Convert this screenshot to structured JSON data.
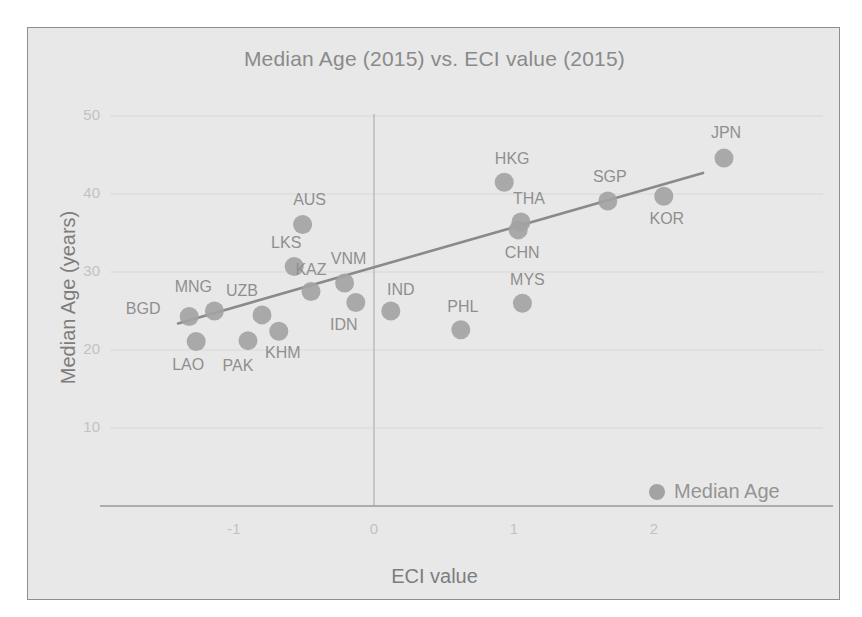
{
  "chart_data": {
    "type": "scatter",
    "title": "Median Age (2015) vs. ECI value (2015)",
    "xlabel": "ECI value",
    "ylabel": "Median Age (years)",
    "xlim": [
      -1.55,
      2.9
    ],
    "ylim": [
      0,
      53
    ],
    "xticks": [
      "-1",
      "0",
      "1",
      "2"
    ],
    "xtick_values": [
      -1,
      0,
      1,
      2
    ],
    "yticks": [
      "10",
      "20",
      "30",
      "40",
      "50"
    ],
    "ytick_values": [
      10,
      20,
      30,
      40,
      50
    ],
    "grid": true,
    "legend": [
      {
        "name": "Median Age",
        "color": "#a3a3a3",
        "marker": "circle"
      }
    ],
    "legend_position": "bottom-right",
    "marker_color": "#a3a3a3",
    "trendline": {
      "color": "#8a8a8a",
      "x_start": -1.4,
      "y_start": 23.4,
      "x_end": 2.35,
      "y_end": 42.7
    },
    "points": [
      {
        "label": "BGD",
        "x": -1.32,
        "y": 24.3,
        "label_dx": -46,
        "label_dy": -7
      },
      {
        "label": "LAO",
        "x": -1.27,
        "y": 21.1,
        "label_dx": -8,
        "label_dy": 24
      },
      {
        "label": "MNG",
        "x": -1.14,
        "y": 25.0,
        "label_dx": -21,
        "label_dy": -24
      },
      {
        "label": "PAK",
        "x": -0.9,
        "y": 21.2,
        "label_dx": -10,
        "label_dy": 25
      },
      {
        "label": "UZB",
        "x": -0.8,
        "y": 24.5,
        "label_dx": -20,
        "label_dy": -24
      },
      {
        "label": "KHM",
        "x": -0.68,
        "y": 22.4,
        "label_dx": 4,
        "label_dy": 22
      },
      {
        "label": "LKS",
        "x": -0.57,
        "y": 30.7,
        "label_dx": -8,
        "label_dy": -24
      },
      {
        "label": "AUS",
        "x": -0.51,
        "y": 36.1,
        "label_dx": 7,
        "label_dy": -24
      },
      {
        "label": "KAZ",
        "x": -0.45,
        "y": 27.5,
        "label_dx": 0,
        "label_dy": -22
      },
      {
        "label": "VNM",
        "x": -0.21,
        "y": 28.6,
        "label_dx": 4,
        "label_dy": -24
      },
      {
        "label": "IDN",
        "x": -0.13,
        "y": 26.1,
        "label_dx": -12,
        "label_dy": 23
      },
      {
        "label": "IND",
        "x": 0.12,
        "y": 25.0,
        "label_dx": 10,
        "label_dy": -21
      },
      {
        "label": "PHL",
        "x": 0.62,
        "y": 22.6,
        "label_dx": 2,
        "label_dy": -23
      },
      {
        "label": "HKG",
        "x": 0.93,
        "y": 41.5,
        "label_dx": 8,
        "label_dy": -23
      },
      {
        "label": "THA",
        "x": 1.05,
        "y": 36.4,
        "label_dx": 8,
        "label_dy": -23
      },
      {
        "label": "CHN",
        "x": 1.03,
        "y": 35.4,
        "label_dx": 4,
        "label_dy": 23
      },
      {
        "label": "MYS",
        "x": 1.06,
        "y": 26.0,
        "label_dx": 5,
        "label_dy": -23
      },
      {
        "label": "SGP",
        "x": 1.67,
        "y": 39.1,
        "label_dx": 2,
        "label_dy": -24
      },
      {
        "label": "KOR",
        "x": 2.07,
        "y": 39.7,
        "label_dx": 3,
        "label_dy": 23
      },
      {
        "label": "JPN",
        "x": 2.5,
        "y": 44.6,
        "label_dx": 2,
        "label_dy": -25
      }
    ]
  },
  "colors": {
    "background": "#e8e8e8",
    "frame_border": "#8e8e8e",
    "marker": "#a3a3a3",
    "trendline": "#8a8a8a",
    "grid": "#d8d8d8",
    "axis": "#9a9a9a",
    "title_text": "#8a8a8a",
    "tick_text": "#c2c2c2",
    "label_text": "#8f8f8f"
  }
}
